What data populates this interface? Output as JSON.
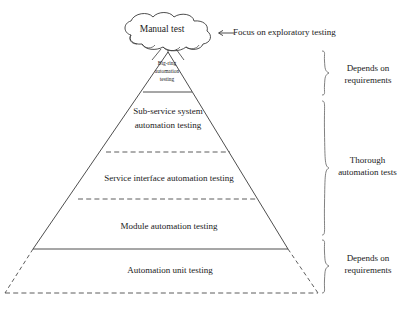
{
  "diagram": {
    "cloud": {
      "label": "Manual test",
      "icon": "cloud-shape"
    },
    "arrow_annotation": {
      "text": "Focus on exploratory testing",
      "icon": "left-arrow-icon"
    },
    "bands": [
      {
        "id": "big-ring",
        "label": "Big-ring\nautomation\ntesting"
      },
      {
        "id": "sub-service",
        "label": "Sub-service system\nautomation testing"
      },
      {
        "id": "service-interface",
        "label": "Service interface automation testing"
      },
      {
        "id": "module",
        "label": "Module automation testing"
      },
      {
        "id": "automation-unit",
        "label": "Automation unit testing"
      }
    ],
    "brace_annotations": [
      {
        "id": "top",
        "label": "Depends on\nrequirements"
      },
      {
        "id": "middle",
        "label": "Thorough\nautomation tests"
      },
      {
        "id": "bottom",
        "label": "Depends on\nrequirements"
      }
    ],
    "colors": {
      "stroke": "#3a3a3a",
      "background": "#ffffff",
      "text": "#1a1a1a"
    }
  }
}
